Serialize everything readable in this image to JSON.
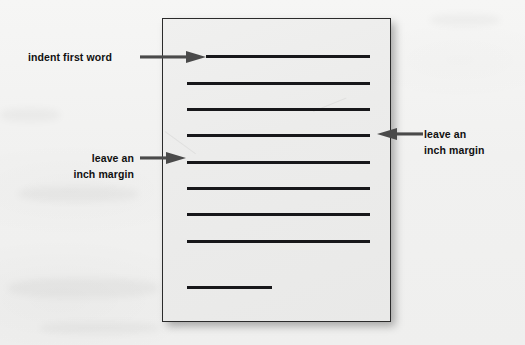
{
  "figure": {
    "type": "handwriting-page-layout-diagram",
    "background_color": "#f1f1f0",
    "paper": {
      "label": "lined-paper-sheet",
      "fill_color": "#ececeb",
      "border_color": "#2b2b2b",
      "x": 162,
      "y": 18,
      "width": 229,
      "height": 304
    },
    "line_color": "#17171a",
    "text_color": "#101010",
    "arrow_color": "#4a4a4a"
  },
  "writing_lines": [
    {
      "name": "line-1-indented",
      "x": 206,
      "y": 55,
      "width": 164,
      "indented": true
    },
    {
      "name": "line-2",
      "x": 187,
      "y": 82,
      "width": 183,
      "indented": false
    },
    {
      "name": "line-3",
      "x": 187,
      "y": 108,
      "width": 183,
      "indented": false
    },
    {
      "name": "line-4",
      "x": 187,
      "y": 134,
      "width": 183,
      "indented": false
    },
    {
      "name": "line-5",
      "x": 187,
      "y": 161,
      "width": 183,
      "indented": false
    },
    {
      "name": "line-6",
      "x": 187,
      "y": 187,
      "width": 183,
      "indented": false
    },
    {
      "name": "line-7",
      "x": 187,
      "y": 213,
      "width": 183,
      "indented": false
    },
    {
      "name": "line-8",
      "x": 187,
      "y": 240,
      "width": 183,
      "indented": false
    },
    {
      "name": "line-9-short",
      "x": 187,
      "y": 286,
      "width": 85,
      "indented": false
    }
  ],
  "annotations": [
    {
      "id": "indent-first-word",
      "text_line_1": "indent first word",
      "text_line_2": "",
      "arrow_direction": "right",
      "points_to": "line-1-indented"
    },
    {
      "id": "left-margin",
      "text_line_1": "leave an",
      "text_line_2": "inch margin",
      "arrow_direction": "right",
      "points_to": "paper-left-margin"
    },
    {
      "id": "right-margin",
      "text_line_1": "leave an",
      "text_line_2": "inch margin",
      "arrow_direction": "left",
      "points_to": "paper-right-margin"
    }
  ],
  "ghost_text": {
    "bottom": "",
    "middle": ""
  }
}
